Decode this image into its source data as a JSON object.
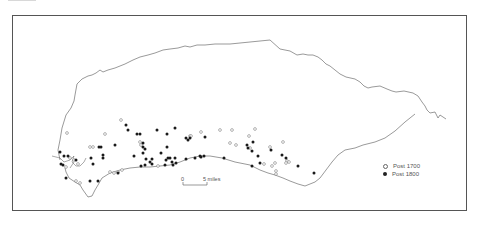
{
  "map": {
    "legend": [
      {
        "symbol": "open-circle",
        "label": "Post 1700"
      },
      {
        "symbol": "filled-circle",
        "label": "Post 1800"
      }
    ],
    "scale_bar": {
      "start_label": "0",
      "end_label": "5 miles"
    },
    "points": {
      "post_1700": [
        [
          67,
          133
        ],
        [
          105,
          134
        ],
        [
          121,
          120
        ],
        [
          90,
          147
        ],
        [
          93,
          147
        ],
        [
          70,
          158
        ],
        [
          74,
          160
        ],
        [
          110,
          172
        ],
        [
          114,
          173
        ],
        [
          118,
          172
        ],
        [
          122,
          170
        ],
        [
          76,
          181
        ],
        [
          80,
          183
        ],
        [
          140,
          142
        ],
        [
          141,
          145
        ],
        [
          158,
          166
        ],
        [
          190,
          136
        ],
        [
          191,
          136
        ],
        [
          201,
          132
        ],
        [
          220,
          130
        ],
        [
          232,
          130
        ],
        [
          230,
          143
        ],
        [
          236,
          145
        ],
        [
          249,
          136
        ],
        [
          255,
          129
        ],
        [
          250,
          148
        ],
        [
          270,
          147
        ],
        [
          275,
          163
        ],
        [
          272,
          166
        ],
        [
          276,
          171
        ],
        [
          276,
          174
        ],
        [
          287,
          161
        ],
        [
          289,
          162
        ],
        [
          286,
          163
        ],
        [
          283,
          142
        ],
        [
          66,
          167
        ],
        [
          78,
          164
        ],
        [
          264,
          164
        ]
      ],
      "post_1800": [
        [
          60,
          152
        ],
        [
          64,
          156
        ],
        [
          68,
          156
        ],
        [
          61,
          164
        ],
        [
          63,
          165
        ],
        [
          76,
          160
        ],
        [
          91,
          158
        ],
        [
          93,
          164
        ],
        [
          99,
          147
        ],
        [
          101,
          147
        ],
        [
          103,
          155
        ],
        [
          103,
          158
        ],
        [
          115,
          145
        ],
        [
          126,
          125
        ],
        [
          128,
          130
        ],
        [
          137,
          134
        ],
        [
          140,
          134
        ],
        [
          143,
          143
        ],
        [
          143,
          147
        ],
        [
          145,
          149
        ],
        [
          143,
          153
        ],
        [
          134,
          156
        ],
        [
          146,
          159
        ],
        [
          152,
          159
        ],
        [
          150,
          162
        ],
        [
          141,
          166
        ],
        [
          145,
          165
        ],
        [
          152,
          164
        ],
        [
          157,
          130
        ],
        [
          167,
          134
        ],
        [
          175,
          128
        ],
        [
          161,
          153
        ],
        [
          167,
          147
        ],
        [
          166,
          160
        ],
        [
          168,
          158
        ],
        [
          170,
          158
        ],
        [
          175,
          158
        ],
        [
          172,
          162
        ],
        [
          173,
          165
        ],
        [
          176,
          163
        ],
        [
          165,
          165
        ],
        [
          186,
          138
        ],
        [
          188,
          140
        ],
        [
          190,
          138
        ],
        [
          205,
          137
        ],
        [
          201,
          157
        ],
        [
          204,
          156
        ],
        [
          186,
          159
        ],
        [
          224,
          158
        ],
        [
          247,
          145
        ],
        [
          248,
          148
        ],
        [
          253,
          142
        ],
        [
          252,
          151
        ],
        [
          258,
          156
        ],
        [
          252,
          166
        ],
        [
          260,
          163
        ],
        [
          271,
          150
        ],
        [
          282,
          155
        ],
        [
          286,
          158
        ],
        [
          298,
          166
        ],
        [
          314,
          173
        ],
        [
          66,
          178
        ],
        [
          90,
          181
        ],
        [
          98,
          181
        ],
        [
          118,
          173
        ],
        [
          200,
          156
        ],
        [
          195,
          158
        ]
      ]
    }
  }
}
